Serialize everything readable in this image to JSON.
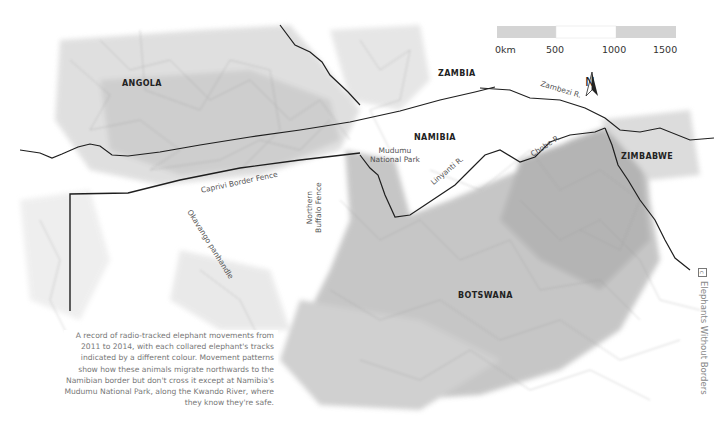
{
  "map": {
    "colors": {
      "background": "#ffffff",
      "track_light": "#d4d4d4",
      "track_mid": "#b0b0b0",
      "track_dark": "#8e8e8e",
      "region_fill": "#cfcfcf",
      "border": "#1e1e1e",
      "fence": "#1e1e1e",
      "label": "#222222",
      "feature_label": "#555555",
      "caption": "#777777"
    },
    "countries": [
      {
        "name": "ANGOLA",
        "x": 122,
        "y": 78
      },
      {
        "name": "ZAMBIA",
        "x": 438,
        "y": 68
      },
      {
        "name": "NAMIBIA",
        "x": 414,
        "y": 132
      },
      {
        "name": "ZIMBABWE",
        "x": 621,
        "y": 151
      },
      {
        "name": "BOTSWANA",
        "x": 458,
        "y": 290
      }
    ],
    "features": {
      "mudumu_park": {
        "line1": "Mudumu",
        "line2": "National Park"
      },
      "zambezi": "Zambezi R.",
      "chobe": "Chobe R.",
      "linyanti": "Linyanti R.",
      "caprivi_fence": "Caprivi Border Fence",
      "okavango": "Okavango panhandle",
      "buffalo_fence": {
        "line1": "Northern",
        "line2": "Buffalo Fence"
      }
    },
    "scale_bar": {
      "labels": [
        "0km",
        "500",
        "1000",
        "1500"
      ],
      "segments": [
        "#d4d4d4",
        "#ffffff",
        "#d4d4d4"
      ]
    },
    "north_arrow": {
      "label": "N"
    }
  },
  "caption": "A record of radio-tracked elephant movements from 2011 to 2014, with each collared elephant's tracks indicated by a different colour. Movement patterns show how these animals migrate northwards to the Namibian border but don't cross it except at Namibia's Mudumu National Park, along the Kwando River, where they know they're safe.",
  "credit": {
    "icon": "cc-icon",
    "text": "Elephants Without Borders"
  }
}
